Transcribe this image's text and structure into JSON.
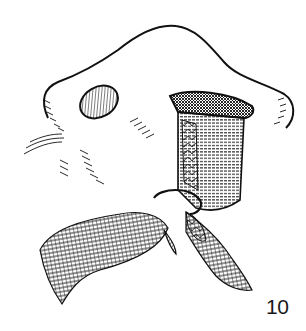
{
  "figure": {
    "label": "10",
    "colors": {
      "ink": "#111111",
      "background": "#ffffff"
    }
  }
}
